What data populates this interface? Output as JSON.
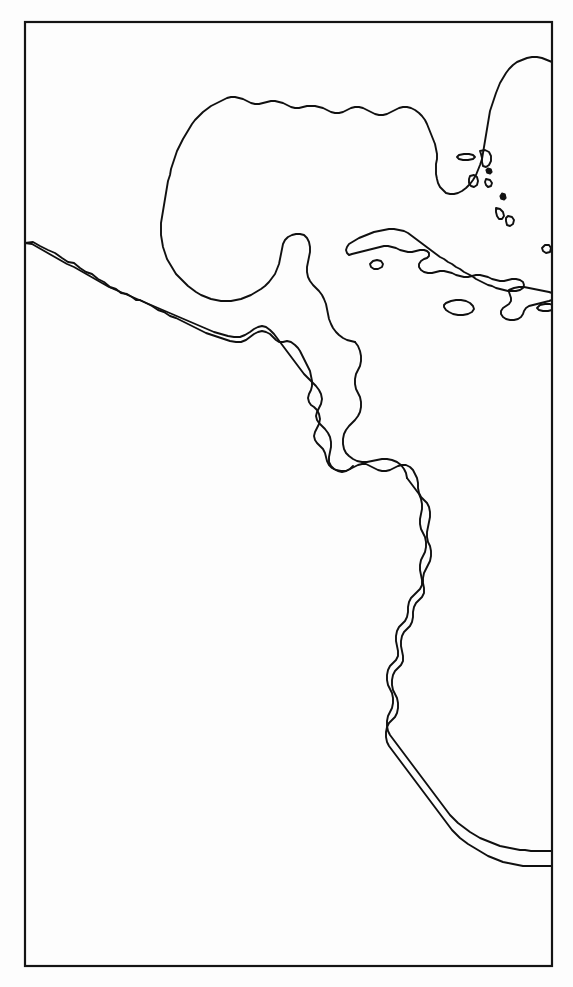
{
  "figure": {
    "kind": "outline-map",
    "title": "",
    "caption": "",
    "width": 573,
    "height": 987,
    "background_color": "#fdfdfd",
    "page_color": "#ffffff"
  },
  "frame": {
    "label": "map-border",
    "x": 25,
    "y": 22,
    "width": 527,
    "height": 944,
    "stroke_color": "#141414",
    "stroke_width": 2.2
  },
  "style": {
    "coastline_color": "#101010",
    "coastline_width": 1.9,
    "land_fill": "none",
    "ocean_fill": "none"
  },
  "region": {
    "name": "Central America, Caribbean and northwestern South America",
    "projection_hint": "equirectangular",
    "extent_note": "Gulf of Mexico and southeastern United States at top; Peru at bottom right"
  },
  "features": {
    "mainland": [
      {
        "name": "north-and-central-america-mainland",
        "type": "coastline",
        "description": "Gulf of Mexico coast, Florida peninsula, Mexico Pacific coast, Yucatan, Central America, Panama and South America Pacific coast"
      }
    ],
    "islands": [
      {
        "name": "cuba",
        "type": "island"
      },
      {
        "name": "isla-de-la-juventud",
        "type": "island"
      },
      {
        "name": "jamaica",
        "type": "island"
      },
      {
        "name": "hispaniola",
        "type": "island"
      },
      {
        "name": "puerto-rico",
        "type": "island"
      },
      {
        "name": "bahamas-andros",
        "type": "island"
      },
      {
        "name": "bahamas-grand-bahama",
        "type": "island"
      },
      {
        "name": "bahamas-abaco",
        "type": "island"
      },
      {
        "name": "bahamas-eleuthera",
        "type": "island"
      },
      {
        "name": "bahamas-cat",
        "type": "island"
      },
      {
        "name": "bahamas-long",
        "type": "island"
      },
      {
        "name": "bahamas-acklins",
        "type": "island"
      },
      {
        "name": "galapagos-islet",
        "type": "islet"
      }
    ]
  },
  "annotations": {
    "labels": [],
    "legend": [],
    "scale_bar": null,
    "north_arrow": null,
    "graticule": null
  }
}
